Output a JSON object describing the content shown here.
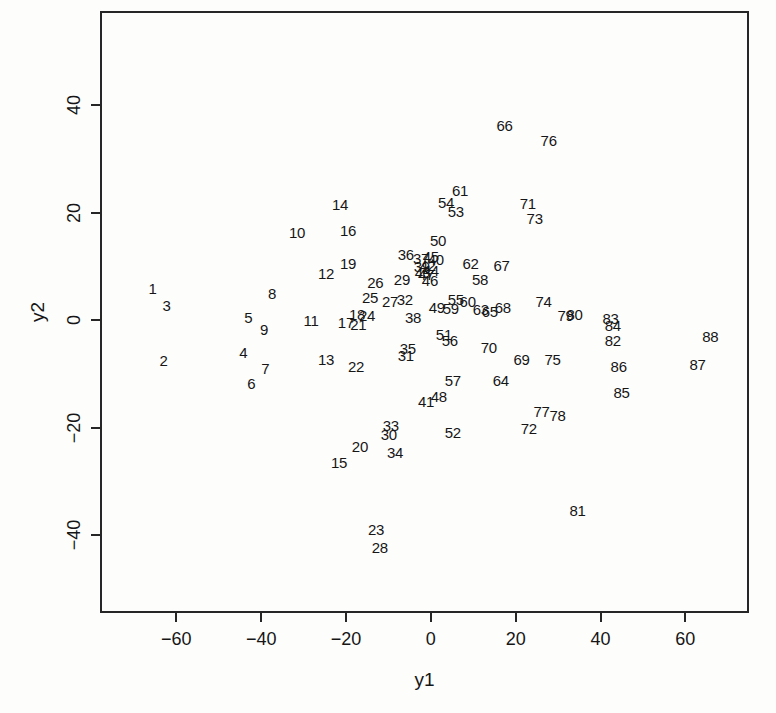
{
  "chart_data": {
    "type": "scatter",
    "title": "",
    "xlabel": "y1",
    "ylabel": "y2",
    "xlim": [
      -78,
      75
    ],
    "ylim": [
      -54.5,
      57.5
    ],
    "grid": false,
    "legend": "none",
    "marker_style": "text-labels-only",
    "x_ticks": [
      -60,
      -40,
      -20,
      0,
      20,
      40,
      60
    ],
    "y_ticks": [
      -40,
      -20,
      0,
      20,
      40
    ],
    "x_tick_labels": [
      "−60",
      "−40",
      "−20",
      "0",
      "20",
      "40",
      "60"
    ],
    "y_tick_labels": [
      "−40",
      "−20",
      "0",
      "20",
      "40"
    ],
    "points": [
      {
        "label": "1",
        "x": -66.1,
        "y": 6.3
      },
      {
        "label": "2",
        "x": -63.5,
        "y": -7.0
      },
      {
        "label": "3",
        "x": -62.8,
        "y": 3.1
      },
      {
        "label": "4",
        "x": -44.7,
        "y": -5.6
      },
      {
        "label": "5",
        "x": -43.5,
        "y": 0.9
      },
      {
        "label": "6",
        "x": -42.8,
        "y": -11.3
      },
      {
        "label": "7",
        "x": -39.5,
        "y": -8.5
      },
      {
        "label": "8",
        "x": -37.9,
        "y": 5.4
      },
      {
        "label": "9",
        "x": -39.8,
        "y": -1.3
      },
      {
        "label": "10",
        "x": -32.0,
        "y": 16.7
      },
      {
        "label": "11",
        "x": -28.7,
        "y": 0.4
      },
      {
        "label": "12",
        "x": -25.2,
        "y": 9.1
      },
      {
        "label": "13",
        "x": -25.2,
        "y": -6.9
      },
      {
        "label": "14",
        "x": -21.9,
        "y": 21.9
      },
      {
        "label": "15",
        "x": -22.1,
        "y": -26.1
      },
      {
        "label": "16",
        "x": -20.0,
        "y": 17.2
      },
      {
        "label": "17",
        "x": -20.5,
        "y": 0.0
      },
      {
        "label": "18",
        "x": -17.9,
        "y": 1.5
      },
      {
        "label": "19",
        "x": -20.0,
        "y": 10.9
      },
      {
        "label": "20",
        "x": -17.2,
        "y": -23.1
      },
      {
        "label": "21",
        "x": -17.6,
        "y": -0.4
      },
      {
        "label": "22",
        "x": -18.1,
        "y": -8.1
      },
      {
        "label": "23",
        "x": -13.4,
        "y": -38.5
      },
      {
        "label": "24",
        "x": -15.5,
        "y": 1.3
      },
      {
        "label": "25",
        "x": -14.8,
        "y": 4.6
      },
      {
        "label": "26",
        "x": -13.6,
        "y": 7.4
      },
      {
        "label": "27",
        "x": -10.1,
        "y": 3.9
      },
      {
        "label": "28",
        "x": -12.5,
        "y": -41.9
      },
      {
        "label": "29",
        "x": -7.3,
        "y": 8.1
      },
      {
        "label": "30",
        "x": -10.4,
        "y": -20.9
      },
      {
        "label": "31",
        "x": -6.4,
        "y": -6.1
      },
      {
        "label": "32",
        "x": -6.6,
        "y": 4.3
      },
      {
        "label": "33",
        "x": -9.9,
        "y": -19.1
      },
      {
        "label": "34",
        "x": -8.9,
        "y": -24.1
      },
      {
        "label": "35",
        "x": -5.9,
        "y": -4.8
      },
      {
        "label": "36",
        "x": -6.4,
        "y": 12.6
      },
      {
        "label": "37",
        "x": -2.8,
        "y": 12.0
      },
      {
        "label": "38",
        "x": -4.7,
        "y": 0.9
      },
      {
        "label": "39",
        "x": -2.6,
        "y": 10.4
      },
      {
        "label": "40",
        "x": 0.7,
        "y": 11.7
      },
      {
        "label": "41",
        "x": -1.6,
        "y": -14.6
      },
      {
        "label": "42",
        "x": -1.2,
        "y": 10.6
      },
      {
        "label": "43",
        "x": -2.4,
        "y": 9.4
      },
      {
        "label": "44",
        "x": -0.5,
        "y": 9.6
      },
      {
        "label": "45",
        "x": -0.5,
        "y": 12.2
      },
      {
        "label": "46",
        "x": -0.7,
        "y": 7.8
      },
      {
        "label": "47",
        "x": -1.6,
        "y": 8.9
      },
      {
        "label": "48",
        "x": 1.4,
        "y": -13.7
      },
      {
        "label": "49",
        "x": 0.9,
        "y": 2.8
      },
      {
        "label": "50",
        "x": 1.2,
        "y": 15.2
      },
      {
        "label": "51",
        "x": 2.6,
        "y": -2.2
      },
      {
        "label": "52",
        "x": 4.7,
        "y": -20.4
      },
      {
        "label": "53",
        "x": 5.4,
        "y": 20.6
      },
      {
        "label": "54",
        "x": 3.1,
        "y": 22.4
      },
      {
        "label": "55",
        "x": 5.4,
        "y": 4.3
      },
      {
        "label": "56",
        "x": 4.0,
        "y": -3.3
      },
      {
        "label": "57",
        "x": 4.7,
        "y": -10.7
      },
      {
        "label": "58",
        "x": 11.1,
        "y": 8.0
      },
      {
        "label": "59",
        "x": 4.2,
        "y": 2.6
      },
      {
        "label": "60",
        "x": 8.2,
        "y": 3.9
      },
      {
        "label": "61",
        "x": 6.4,
        "y": 24.6
      },
      {
        "label": "62",
        "x": 8.9,
        "y": 10.9
      },
      {
        "label": "63",
        "x": 11.3,
        "y": 2.4
      },
      {
        "label": "64",
        "x": 16.0,
        "y": -10.7
      },
      {
        "label": "65",
        "x": 13.4,
        "y": 2.0
      },
      {
        "label": "66",
        "x": 16.9,
        "y": 36.7
      },
      {
        "label": "67",
        "x": 16.2,
        "y": 10.7
      },
      {
        "label": "68",
        "x": 16.5,
        "y": 2.8
      },
      {
        "label": "69",
        "x": 20.9,
        "y": -6.9
      },
      {
        "label": "70",
        "x": 13.2,
        "y": -4.6
      },
      {
        "label": "71",
        "x": 22.4,
        "y": 22.2
      },
      {
        "label": "72",
        "x": 22.6,
        "y": -19.8
      },
      {
        "label": "73",
        "x": 24.0,
        "y": 19.3
      },
      {
        "label": "74",
        "x": 26.1,
        "y": 3.9
      },
      {
        "label": "75",
        "x": 28.2,
        "y": -6.9
      },
      {
        "label": "76",
        "x": 27.3,
        "y": 33.9
      },
      {
        "label": "77",
        "x": 25.6,
        "y": -16.5
      },
      {
        "label": "78",
        "x": 29.4,
        "y": -17.2
      },
      {
        "label": "79",
        "x": 31.3,
        "y": 1.3
      },
      {
        "label": "80",
        "x": 33.4,
        "y": 1.5
      },
      {
        "label": "81",
        "x": 34.1,
        "y": -35.0
      },
      {
        "label": "82",
        "x": 42.4,
        "y": -3.3
      },
      {
        "label": "83",
        "x": 41.9,
        "y": 0.7
      },
      {
        "label": "84",
        "x": 42.4,
        "y": -0.6
      },
      {
        "label": "85",
        "x": 44.5,
        "y": -13.0
      },
      {
        "label": "86",
        "x": 43.8,
        "y": -8.1
      },
      {
        "label": "87",
        "x": 62.4,
        "y": -7.8
      },
      {
        "label": "88",
        "x": 65.4,
        "y": -2.6
      }
    ],
    "colors": {
      "text": "#161616",
      "background": "#fdfdfc",
      "axis": "#262626"
    }
  }
}
